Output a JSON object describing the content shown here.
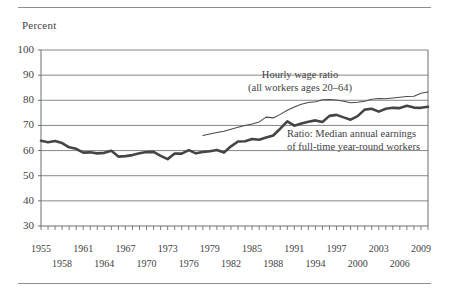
{
  "chart_data": {
    "type": "line",
    "title": "",
    "subtitle": "",
    "ylabel": "Percent",
    "xlabel": "",
    "ylim": [
      30,
      100
    ],
    "yticks": [
      30,
      40,
      50,
      60,
      70,
      80,
      90,
      100
    ],
    "xlim": [
      1955,
      2010
    ],
    "grid": true,
    "legend_position": "inline-annotations",
    "xticks_top": [
      1955,
      1961,
      1967,
      1973,
      1979,
      1985,
      1991,
      1997,
      2003,
      2009
    ],
    "xticks_bottom": [
      1958,
      1964,
      1970,
      1976,
      1982,
      1988,
      1994,
      2000,
      2006
    ],
    "annotations": [
      {
        "name": "hourly-wage-ratio",
        "lines": [
          "Hourly wage ratio",
          "(all workers ages 20–64)"
        ]
      },
      {
        "name": "median-annual-earnings-ratio",
        "lines": [
          "Ratio: Median annual earnings",
          "of full-time year-round workers"
        ]
      }
    ],
    "series": [
      {
        "name": "Hourly wage ratio (all workers ages 20–64)",
        "style": "thin",
        "color": "#4a4a4a",
        "x": [
          1978,
          1979,
          1980,
          1981,
          1982,
          1983,
          1984,
          1985,
          1986,
          1987,
          1988,
          1989,
          1990,
          1991,
          1992,
          1993,
          1994,
          1995,
          1996,
          1997,
          1998,
          1999,
          2000,
          2001,
          2002,
          2003,
          2004,
          2005,
          2006,
          2007,
          2008,
          2009,
          2010
        ],
        "values": [
          66.0,
          66.6,
          67.2,
          67.7,
          68.5,
          69.3,
          70.0,
          70.6,
          71.4,
          73.3,
          73.0,
          74.4,
          76.0,
          77.3,
          78.4,
          79.1,
          79.4,
          80.2,
          80.3,
          80.1,
          79.6,
          79.0,
          79.2,
          79.6,
          80.4,
          80.7,
          80.6,
          80.9,
          81.2,
          81.5,
          81.6,
          82.8,
          83.3
        ]
      },
      {
        "name": "Ratio: Median annual earnings of full-time year-round workers",
        "style": "thick",
        "color": "#454545",
        "x": [
          1955,
          1956,
          1957,
          1958,
          1959,
          1960,
          1961,
          1962,
          1963,
          1964,
          1965,
          1966,
          1967,
          1968,
          1969,
          1970,
          1971,
          1972,
          1973,
          1974,
          1975,
          1976,
          1977,
          1978,
          1979,
          1980,
          1981,
          1982,
          1983,
          1984,
          1985,
          1986,
          1987,
          1988,
          1989,
          1990,
          1991,
          1992,
          1993,
          1994,
          1995,
          1996,
          1997,
          1998,
          1999,
          2000,
          2001,
          2002,
          2003,
          2004,
          2005,
          2006,
          2007,
          2008,
          2009,
          2010
        ],
        "values": [
          63.9,
          63.3,
          63.8,
          63.0,
          61.3,
          60.7,
          59.2,
          59.3,
          58.9,
          59.1,
          59.9,
          57.6,
          57.8,
          58.2,
          58.9,
          59.4,
          59.5,
          57.9,
          56.6,
          58.8,
          58.8,
          60.2,
          58.9,
          59.4,
          59.7,
          60.2,
          59.2,
          61.7,
          63.6,
          63.7,
          64.6,
          64.3,
          65.2,
          66.0,
          68.7,
          71.6,
          69.9,
          70.8,
          71.5,
          72.0,
          71.4,
          73.8,
          74.2,
          73.2,
          72.3,
          73.7,
          76.3,
          76.6,
          75.5,
          76.6,
          77.0,
          76.9,
          77.8,
          77.1,
          77.0,
          77.4
        ]
      }
    ]
  }
}
